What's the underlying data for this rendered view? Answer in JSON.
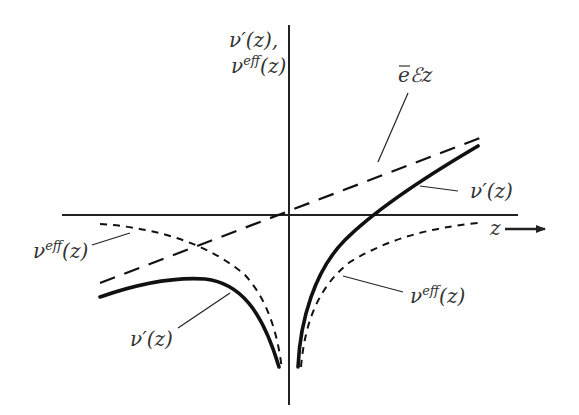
{
  "diagram": {
    "type": "potential-curves-plot",
    "y_axis_label": {
      "line1_base": "ν′(z),",
      "line2_base": "ν",
      "line2_sup": "eff",
      "line2_arg": "(z)"
    },
    "x_axis_label": "z",
    "curves": [
      {
        "id": "field-line",
        "style": "long-dashed",
        "label": "ēℰz",
        "label_base": "e",
        "label_rest": "ℰz"
      },
      {
        "id": "v-prime-right",
        "style": "solid-thick",
        "label": "ν′(z)"
      },
      {
        "id": "v-prime-left",
        "style": "solid-thick",
        "label": "ν′(z)"
      },
      {
        "id": "v-eff-left",
        "style": "short-dashed",
        "label_base": "ν",
        "label_sup": "eff",
        "label_arg": "(z)"
      },
      {
        "id": "v-eff-right",
        "style": "short-dashed",
        "label_base": "ν",
        "label_sup": "eff",
        "label_arg": "(z)"
      }
    ],
    "colors": {
      "background": "#ffffff",
      "ink": "#111111",
      "text": "#333333"
    }
  }
}
